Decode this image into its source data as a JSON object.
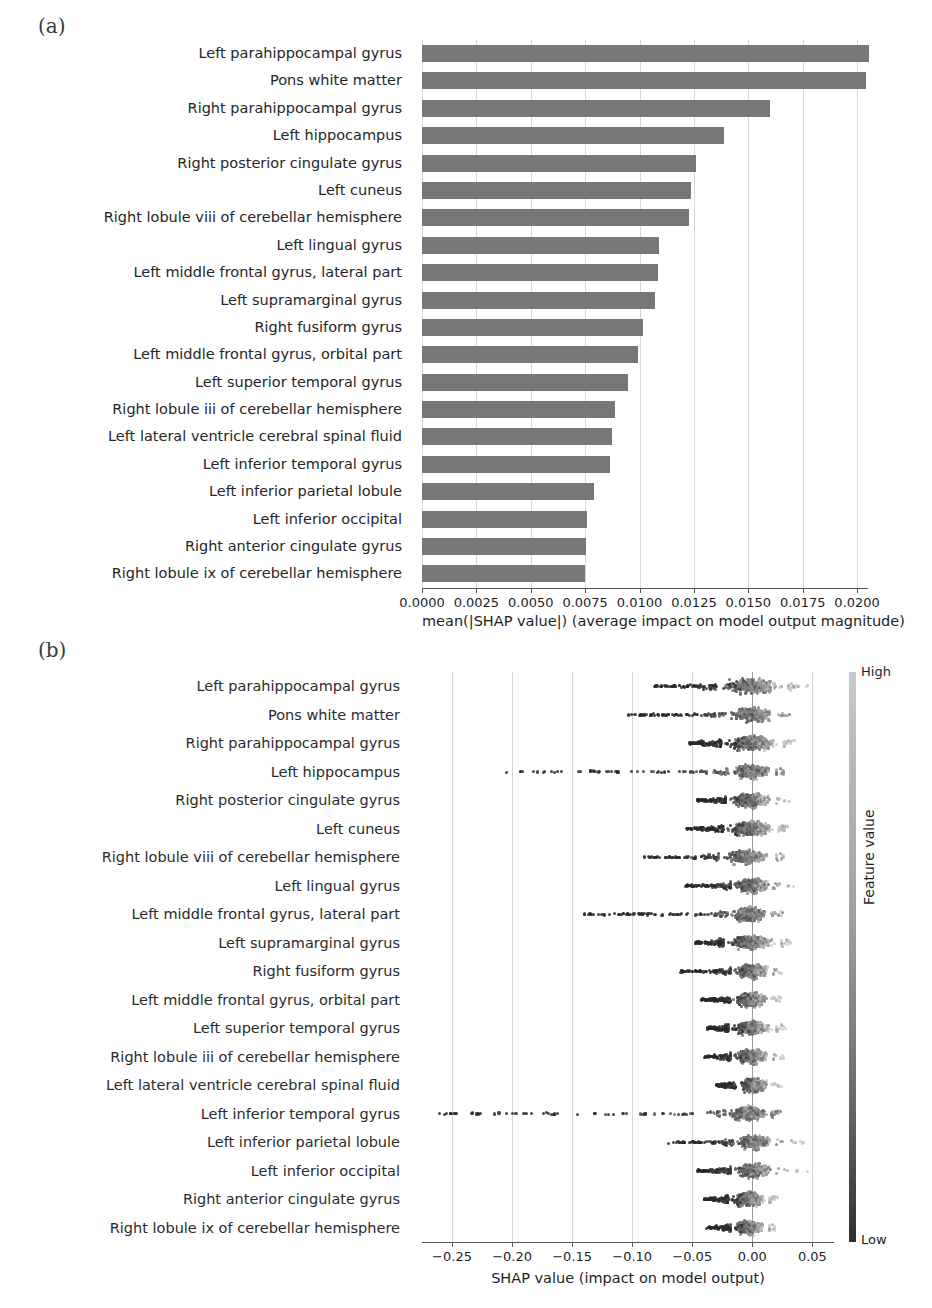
{
  "figure": {
    "panel_a_tag": "(a)",
    "panel_b_tag": "(b)"
  },
  "features": [
    "Left parahippocampal gyrus",
    "Pons white matter",
    "Right parahippocampal gyrus",
    "Left hippocampus",
    "Right posterior cingulate gyrus",
    "Left cuneus",
    "Right lobule viii of cerebellar hemisphere",
    "Left lingual gyrus",
    "Left middle frontal gyrus, lateral part",
    "Left supramarginal gyrus",
    "Right fusiform gyrus",
    "Left middle frontal gyrus, orbital part",
    "Left superior temporal gyrus",
    "Right lobule iii of cerebellar hemisphere",
    "Left lateral ventricle cerebral spinal fluid",
    "Left inferior temporal gyrus",
    "Left inferior parietal lobule",
    "Left inferior occipital",
    "Right anterior cingulate gyrus",
    "Right lobule ix of cerebellar hemisphere"
  ],
  "chart_data": [
    {
      "type": "bar",
      "panel": "(a)",
      "orientation": "horizontal",
      "title": "",
      "xlabel": "mean(|SHAP value|) (average impact on model output magnitude)",
      "ylabel": "",
      "xlim": [
        0.0,
        0.0205
      ],
      "xticks": [
        0.0,
        0.0025,
        0.005,
        0.0075,
        0.01,
        0.0125,
        0.015,
        0.0175,
        0.02
      ],
      "xticklabels": [
        "0.0000",
        "0.0025",
        "0.0050",
        "0.0075",
        "0.0100",
        "0.0125",
        "0.0150",
        "0.0175",
        "0.0200"
      ],
      "grid": true,
      "bar_color": "#777777",
      "categories": [
        "Left parahippocampal gyrus",
        "Pons white matter",
        "Right parahippocampal gyrus",
        "Left hippocampus",
        "Right posterior cingulate gyrus",
        "Left cuneus",
        "Right lobule viii of cerebellar hemisphere",
        "Left lingual gyrus",
        "Left middle frontal gyrus, lateral part",
        "Left supramarginal gyrus",
        "Right fusiform gyrus",
        "Left middle frontal gyrus, orbital part",
        "Left superior temporal gyrus",
        "Right lobule iii of cerebellar hemisphere",
        "Left lateral ventricle cerebral spinal fluid",
        "Left inferior temporal gyrus",
        "Left inferior parietal lobule",
        "Left inferior occipital",
        "Right anterior cingulate gyrus",
        "Right lobule ix of cerebellar hemisphere"
      ],
      "values": [
        0.02055,
        0.0204,
        0.016,
        0.0139,
        0.0126,
        0.01235,
        0.01225,
        0.0109,
        0.01085,
        0.0107,
        0.01015,
        0.00995,
        0.00945,
        0.00885,
        0.00875,
        0.00865,
        0.0079,
        0.0076,
        0.00755,
        0.0075
      ]
    },
    {
      "type": "scatter",
      "subtype": "beeswarm",
      "panel": "(b)",
      "title": "",
      "xlabel": "SHAP value (impact on model output)",
      "ylabel": "",
      "xlim": [
        -0.275,
        0.068
      ],
      "xticks": [
        -0.25,
        -0.2,
        -0.15,
        -0.1,
        -0.05,
        0.0,
        0.05
      ],
      "xticklabels": [
        "−0.25",
        "−0.20",
        "−0.15",
        "−0.10",
        "−0.05",
        "0.00",
        "0.05"
      ],
      "grid": true,
      "legend": {
        "title": "Feature value",
        "high_label": "High",
        "low_label": "Low",
        "position": "right",
        "colormap_high": "#c9c9c9",
        "colormap_low": "#2f2f2f"
      },
      "rows": [
        {
          "feature": "Left parahippocampal gyrus",
          "min": -0.082,
          "max": 0.047,
          "dense_from": -0.03,
          "dense_to": 0.03
        },
        {
          "feature": "Pons white matter",
          "min": -0.103,
          "max": 0.032,
          "dense_from": -0.022,
          "dense_to": 0.022
        },
        {
          "feature": "Right parahippocampal gyrus",
          "min": -0.052,
          "max": 0.036,
          "dense_from": -0.026,
          "dense_to": 0.026
        },
        {
          "feature": "Left hippocampus",
          "min": -0.205,
          "max": 0.028,
          "dense_from": -0.02,
          "dense_to": 0.02
        },
        {
          "feature": "Right posterior cingulate gyrus",
          "min": -0.046,
          "max": 0.033,
          "dense_from": -0.022,
          "dense_to": 0.02
        },
        {
          "feature": "Left cuneus",
          "min": -0.055,
          "max": 0.03,
          "dense_from": -0.024,
          "dense_to": 0.022
        },
        {
          "feature": "Right lobule viii of cerebellar hemisphere",
          "min": -0.094,
          "max": 0.028,
          "dense_from": -0.028,
          "dense_to": 0.02
        },
        {
          "feature": "Left lingual gyrus",
          "min": -0.056,
          "max": 0.04,
          "dense_from": -0.018,
          "dense_to": 0.018
        },
        {
          "feature": "Left middle frontal gyrus, lateral part",
          "min": -0.14,
          "max": 0.026,
          "dense_from": -0.02,
          "dense_to": 0.016
        },
        {
          "feature": "Left supramarginal gyrus",
          "min": -0.048,
          "max": 0.034,
          "dense_from": -0.024,
          "dense_to": 0.024
        },
        {
          "feature": "Right fusiform gyrus",
          "min": -0.06,
          "max": 0.026,
          "dense_from": -0.018,
          "dense_to": 0.018
        },
        {
          "feature": "Left middle frontal gyrus, orbital part",
          "min": -0.042,
          "max": 0.024,
          "dense_from": -0.018,
          "dense_to": 0.016
        },
        {
          "feature": "Left superior temporal gyrus",
          "min": -0.038,
          "max": 0.03,
          "dense_from": -0.02,
          "dense_to": 0.02
        },
        {
          "feature": "Right lobule iii of cerebellar hemisphere",
          "min": -0.04,
          "max": 0.028,
          "dense_from": -0.018,
          "dense_to": 0.018
        },
        {
          "feature": "Left lateral ventricle cerebral spinal fluid",
          "min": -0.03,
          "max": 0.026,
          "dense_from": -0.014,
          "dense_to": 0.016
        },
        {
          "feature": "Left inferior temporal gyrus",
          "min": -0.262,
          "max": 0.024,
          "dense_from": -0.022,
          "dense_to": 0.016
        },
        {
          "feature": "Left inferior parietal lobule",
          "min": -0.07,
          "max": 0.049,
          "dense_from": -0.016,
          "dense_to": 0.02
        },
        {
          "feature": "Left inferior occipital",
          "min": -0.046,
          "max": 0.052,
          "dense_from": -0.018,
          "dense_to": 0.02
        },
        {
          "feature": "Right anterior cingulate gyrus",
          "min": -0.04,
          "max": 0.022,
          "dense_from": -0.02,
          "dense_to": 0.014
        },
        {
          "feature": "Right lobule ix of cerebellar hemisphere",
          "min": -0.038,
          "max": 0.02,
          "dense_from": -0.018,
          "dense_to": 0.014
        }
      ]
    }
  ]
}
